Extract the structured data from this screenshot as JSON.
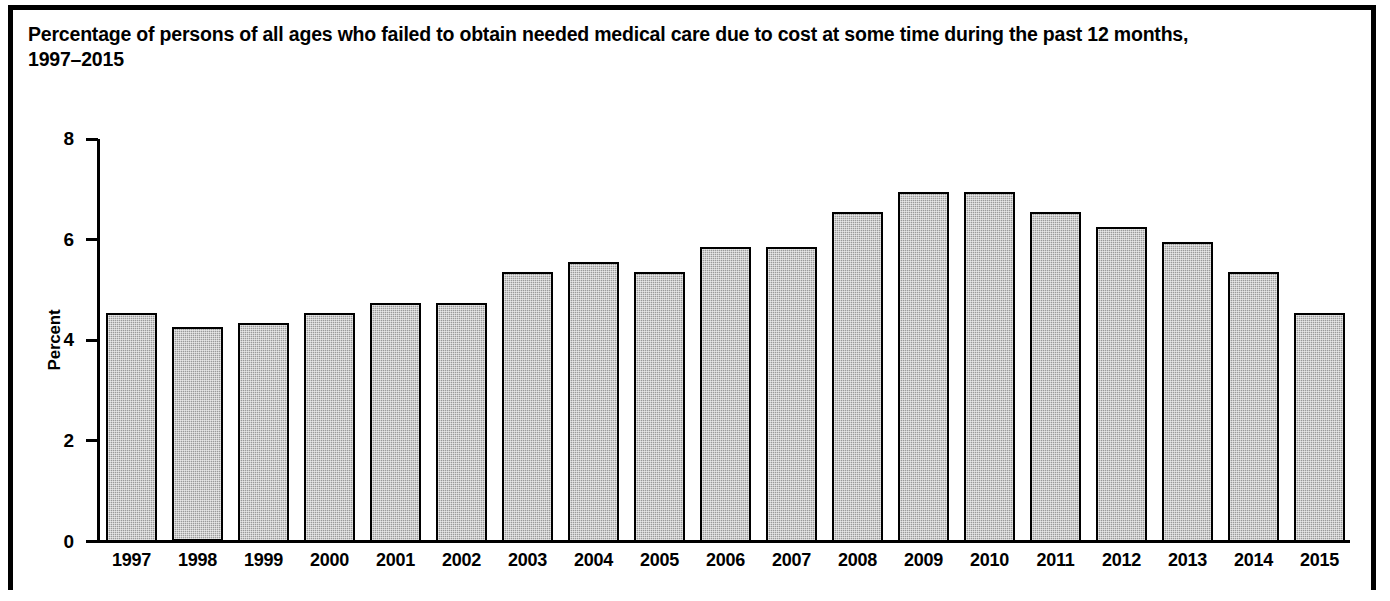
{
  "figure": {
    "title_line1": "Percentage of persons of all ages who failed to obtain needed medical care due to cost at some time during the past 12 months,",
    "title_line2": "1997–2015",
    "border_color": "#000000",
    "background_color": "#ffffff"
  },
  "chart_data": {
    "type": "bar",
    "title": "Percentage of persons of all ages who failed to obtain needed medical care due to cost at some time during the past 12 months, 1997–2015",
    "xlabel": "",
    "ylabel": "Percent",
    "ylim": [
      0,
      8
    ],
    "yticks": [
      0,
      2,
      4,
      6,
      8
    ],
    "ytick_labels": [
      "0",
      "2",
      "4",
      "6",
      "8"
    ],
    "grid": false,
    "legend": false,
    "bar_fill_color": "#9b9b9b",
    "bar_edge_color": "#000000",
    "categories": [
      "1997",
      "1998",
      "1999",
      "2000",
      "2001",
      "2002",
      "2003",
      "2004",
      "2005",
      "2006",
      "2007",
      "2008",
      "2009",
      "2010",
      "2011",
      "2012",
      "2013",
      "2014",
      "2015"
    ],
    "values": [
      4.55,
      4.27,
      4.35,
      4.55,
      4.75,
      4.75,
      5.35,
      5.55,
      5.35,
      5.85,
      5.85,
      6.55,
      6.95,
      6.95,
      6.55,
      6.25,
      5.95,
      5.35,
      4.55
    ]
  }
}
